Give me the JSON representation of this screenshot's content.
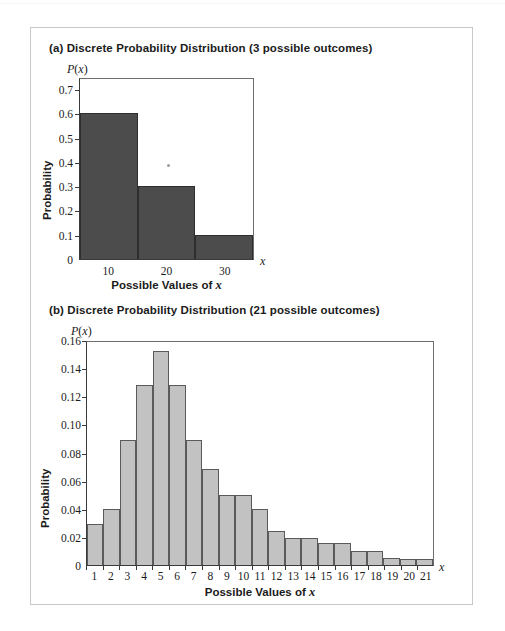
{
  "figure": {
    "panel_a": {
      "title": "(a) Discrete Probability Distribution (3 possible outcomes)",
      "y_axis_symbol": "P(x)",
      "x_axis_symbol": "x",
      "ylabel": "Probability",
      "xlabel": "Possible Values of x"
    },
    "panel_b": {
      "title": "(b) Discrete Probability Distribution (21 possible outcomes)",
      "y_axis_symbol": "P(x)",
      "x_axis_symbol": "x",
      "ylabel": "Probability",
      "xlabel": "Possible Values of x"
    }
  },
  "colors": {
    "bar_a_fill": "#4c4c4c",
    "bar_a_stroke": "#2e2e2e",
    "bar_b_fill": "#c2c2c2",
    "bar_b_stroke": "#5a5a5a",
    "axis": "#3a3a3a",
    "frame": "#c8c8c8",
    "text": "#1b1b1b"
  },
  "chart_data": [
    {
      "type": "bar",
      "id": "panel-a",
      "title": "(a) Discrete Probability Distribution (3 possible outcomes)",
      "xlabel": "Possible Values of x",
      "ylabel": "Probability",
      "x_axis_symbol": "x",
      "y_axis_symbol": "P(x)",
      "categories": [
        "10",
        "20",
        "30"
      ],
      "values": [
        0.6,
        0.3,
        0.1
      ],
      "bar_centers": [
        10,
        20,
        30
      ],
      "bar_width": 10,
      "ylim": [
        0,
        0.75
      ],
      "yticks": [
        0,
        0.1,
        0.2,
        0.3,
        0.4,
        0.5,
        0.6,
        0.7
      ],
      "ytick_labels": [
        "0",
        "0.1",
        "0.2",
        "0.3",
        "0.4",
        "0.5",
        "0.6",
        "0.7"
      ],
      "xlim": [
        5,
        35
      ],
      "xticks": [
        10,
        20,
        30
      ],
      "xtick_labels": [
        "10",
        "20",
        "30"
      ],
      "grid": false,
      "legend": "none"
    },
    {
      "type": "bar",
      "id": "panel-b",
      "title": "(b) Discrete Probability Distribution (21 possible outcomes)",
      "xlabel": "Possible Values of x",
      "ylabel": "Probability",
      "x_axis_symbol": "x",
      "y_axis_symbol": "P(x)",
      "categories": [
        "1",
        "2",
        "3",
        "4",
        "5",
        "6",
        "7",
        "8",
        "9",
        "10",
        "11",
        "12",
        "13",
        "14",
        "15",
        "16",
        "17",
        "18",
        "19",
        "20",
        "21"
      ],
      "values": [
        0.029,
        0.04,
        0.089,
        0.128,
        0.152,
        0.128,
        0.089,
        0.068,
        0.05,
        0.05,
        0.04,
        0.024,
        0.019,
        0.019,
        0.016,
        0.016,
        0.01,
        0.01,
        0.005,
        0.004,
        0.004
      ],
      "ylim": [
        0,
        0.16
      ],
      "yticks": [
        0,
        0.02,
        0.04,
        0.06,
        0.08,
        0.1,
        0.12,
        0.14,
        0.16
      ],
      "ytick_labels": [
        "0",
        "0.02",
        "0.04",
        "0.06",
        "0.08",
        "0.10",
        "0.12",
        "0.14",
        "0.16"
      ],
      "xlim": [
        0.5,
        21.5
      ],
      "xticks": [
        1,
        2,
        3,
        4,
        5,
        6,
        7,
        8,
        9,
        10,
        11,
        12,
        13,
        14,
        15,
        16,
        17,
        18,
        19,
        20,
        21
      ],
      "xtick_labels": [
        "1",
        "2",
        "3",
        "4",
        "5",
        "6",
        "7",
        "8",
        "9",
        "10",
        "11",
        "12",
        "13",
        "14",
        "15",
        "16",
        "17",
        "18",
        "19",
        "20",
        "21"
      ],
      "grid": false,
      "legend": "none"
    }
  ]
}
